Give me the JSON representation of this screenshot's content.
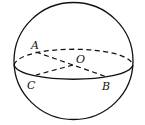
{
  "diagram": {
    "type": "sphere-with-great-circle",
    "colors": {
      "stroke": "#111111",
      "background": "#ffffff"
    },
    "labels": {
      "A": "A",
      "O": "O",
      "C": "C",
      "B": "B"
    }
  }
}
